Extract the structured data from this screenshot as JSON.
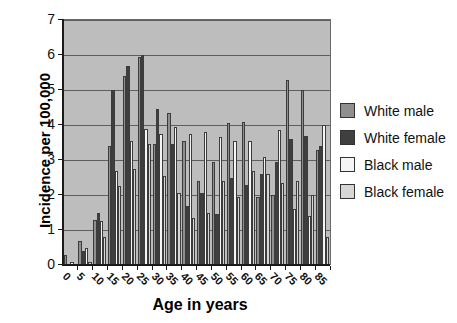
{
  "chart_data": {
    "type": "bar",
    "title": "",
    "xlabel": "Age in years",
    "ylabel": "Incidence per 100,000",
    "categories": [
      "0",
      "5",
      "10",
      "15",
      "20",
      "25",
      "30",
      "35",
      "40",
      "45",
      "50",
      "55",
      "60",
      "65",
      "70",
      "75",
      "80",
      "85"
    ],
    "series": [
      {
        "name": "White male",
        "color": "#8f8f8f",
        "values": [
          0.3,
          0.7,
          1.3,
          3.4,
          5.4,
          5.95,
          3.45,
          4.35,
          3.55,
          2.4,
          2.95,
          4.05,
          4.1,
          1.95,
          2.0,
          5.3,
          5.0,
          3.3
        ]
      },
      {
        "name": "White female",
        "color": "#3f3f3f",
        "values": [
          0,
          0.4,
          1.5,
          5.0,
          5.7,
          6.0,
          4.45,
          3.45,
          1.7,
          2.05,
          1.45,
          2.5,
          2.3,
          2.6,
          2.95,
          3.6,
          3.7,
          3.4
        ]
      },
      {
        "name": "Black male",
        "color": "#f5f5f5",
        "values": [
          0.1,
          0.5,
          1.25,
          2.7,
          3.55,
          3.9,
          3.75,
          3.95,
          3.75,
          3.8,
          3.65,
          3.55,
          3.55,
          3.1,
          3.85,
          1.6,
          1.4,
          4.0
        ]
      },
      {
        "name": "Black female",
        "color": "#d6d6d6",
        "values": [
          0,
          0.1,
          0.8,
          2.25,
          2.75,
          3.45,
          2.55,
          2.05,
          1.35,
          1.5,
          2.4,
          1.95,
          2.7,
          2.6,
          2.35,
          2.4,
          2.0,
          0.8
        ]
      }
    ],
    "ylim": [
      0,
      7
    ],
    "ytick_step": 1,
    "grid": true,
    "plot_bg": "#bdbdbd",
    "legend_position": "right"
  }
}
